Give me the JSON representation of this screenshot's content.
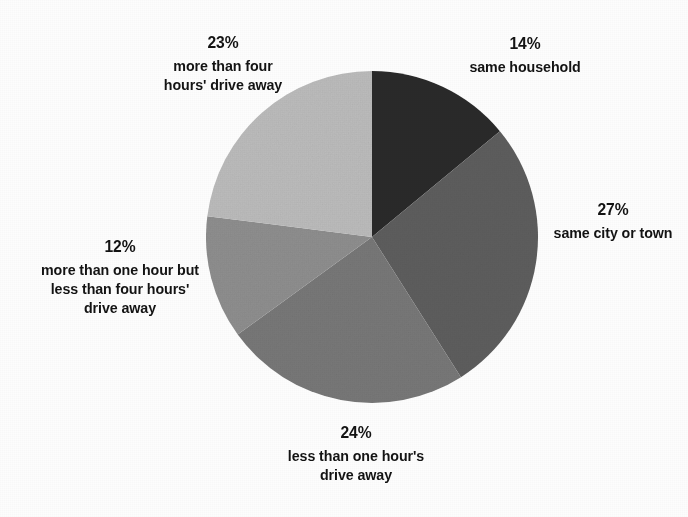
{
  "chart_data": {
    "type": "pie",
    "title": "",
    "start_angle_deg": 0,
    "direction": "clockwise",
    "grid": false,
    "legend": "none",
    "label_format": "percent-above-description",
    "categories": [
      "same household",
      "same city or town",
      "less than one hour's drive away",
      "more than one hour but less than four hours' drive away",
      "more than four hours' drive away"
    ],
    "values": [
      14,
      27,
      24,
      12,
      23
    ],
    "unit": "%",
    "slices": [
      {
        "id": "same-household",
        "percent": 14,
        "percent_text": "14%",
        "description_lines": [
          "same household"
        ],
        "color": "#2b2b2b",
        "start_deg": 0,
        "end_deg": 50.4
      },
      {
        "id": "same-city",
        "percent": 27,
        "percent_text": "27%",
        "description_lines": [
          "same city or town"
        ],
        "color": "#5e5e5e",
        "start_deg": 50.4,
        "end_deg": 147.6
      },
      {
        "id": "less-one-hour",
        "percent": 24,
        "percent_text": "24%",
        "description_lines": [
          "less than one hour's",
          "drive away"
        ],
        "color": "#787878",
        "start_deg": 147.6,
        "end_deg": 234.0
      },
      {
        "id": "one-to-four-hours",
        "percent": 12,
        "percent_text": "12%",
        "description_lines": [
          "more than one hour but",
          "less than four hours'",
          "drive away"
        ],
        "color": "#8f8f8f",
        "start_deg": 234.0,
        "end_deg": 277.2
      },
      {
        "id": "more-four-hours",
        "percent": 23,
        "percent_text": "23%",
        "description_lines": [
          "more than four",
          "hours' drive away"
        ],
        "color": "#bcbcbc",
        "start_deg": 277.2,
        "end_deg": 360.0
      }
    ]
  },
  "labels": {
    "same_household": {
      "percent": "14%",
      "line1": "same household"
    },
    "same_city": {
      "percent": "27%",
      "line1": "same city or town"
    },
    "less_one_hour": {
      "percent": "24%",
      "line1": "less than one hour's",
      "line2": "drive away"
    },
    "one_to_four": {
      "percent": "12%",
      "line1": "more than one hour but",
      "line2": "less than four hours'",
      "line3": "drive away"
    },
    "more_four": {
      "percent": "23%",
      "line1": "more than four",
      "line2": "hours' drive away"
    }
  }
}
